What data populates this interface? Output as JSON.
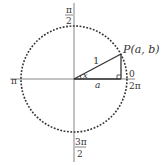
{
  "diagram": {
    "point_label": "P(a, b)",
    "radius_label": "1",
    "angle_label": "x",
    "adjacent_label": "a",
    "axis_labels": {
      "top_num": "π",
      "top_den": "2",
      "left": "π",
      "right_top": "0",
      "right_bottom": "2π",
      "bottom_num": "3π",
      "bottom_den": "2"
    },
    "colors": {
      "line": "#333333",
      "axis": "#555555",
      "background": "#ffffff"
    }
  }
}
